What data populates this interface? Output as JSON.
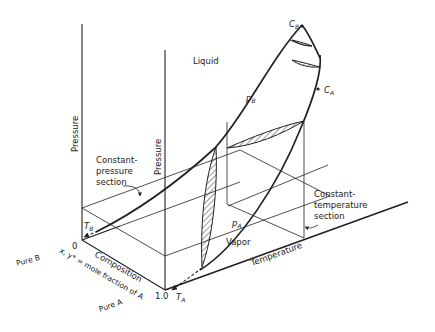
{
  "diagram": {
    "labels": {
      "liquid": "Liquid",
      "vapor": "Vapor",
      "pressure_left": "Pressure",
      "pressure_right": "Pressure",
      "temperature": "Temperature",
      "composition": "Composition",
      "composition_def": "x, y* = mole fraction of A",
      "pure_b": "Pure B",
      "pure_a": "Pure A",
      "zero": "0",
      "one": "1.0",
      "const_pressure_1": "Constant-",
      "const_pressure_2": "pressure",
      "const_pressure_3": "section",
      "const_temp_1": "Constant-",
      "const_temp_2": "temperature",
      "const_temp_3": "section",
      "cb": "C",
      "cb_sub": "B",
      "ca": "C",
      "ca_sub": "A",
      "pb": "p",
      "pb_sub": "B",
      "pa": "p",
      "pa_sub": "A",
      "tb": "T",
      "tb_sub": "B",
      "ta": "T",
      "ta_sub": "A"
    }
  }
}
